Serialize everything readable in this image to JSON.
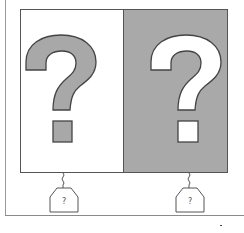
{
  "diagram": {
    "panels": [
      {
        "name": "left",
        "background": "#ffffff",
        "glyph_fill": "#a8a8a8",
        "glyph": "?"
      },
      {
        "name": "right",
        "background": "#a9a9a9",
        "glyph_fill": "#ffffff",
        "glyph": "?"
      }
    ],
    "tags": [
      {
        "label": "?"
      },
      {
        "label": "?"
      }
    ],
    "colors": {
      "outline": "#555555",
      "gray": "#a9a9a9",
      "white": "#ffffff"
    }
  }
}
